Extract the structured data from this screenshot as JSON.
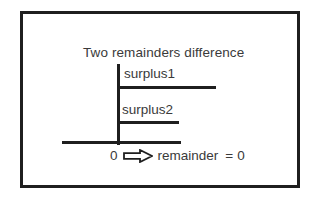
{
  "diagram": {
    "title": "Two remainders difference",
    "branches": [
      {
        "label": "surplus1"
      },
      {
        "label": "surplus2"
      }
    ],
    "bottom": {
      "start_value": "0",
      "arrow_icon": "right-block-arrow-icon",
      "result_label": "remainder",
      "equals": "=",
      "result_value": "0"
    },
    "colors": {
      "stroke": "#1f1f1f",
      "text": "#3a3a3a",
      "background": "#ffffff",
      "arrow_fill": "#ffffff"
    }
  }
}
